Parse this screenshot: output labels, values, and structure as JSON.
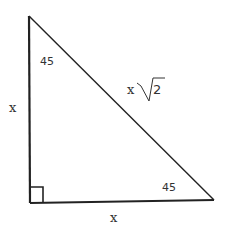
{
  "diagram": {
    "type": "right-triangle-45-45-90",
    "labels": {
      "left_leg": "x",
      "bottom_leg": "x",
      "hypotenuse_coef": "x",
      "hypotenuse_radicand": "2",
      "top_angle": "45",
      "right_angle_label": "45"
    },
    "colors": {
      "stroke": "#222222",
      "text": "#333333",
      "background": "#ffffff"
    }
  }
}
